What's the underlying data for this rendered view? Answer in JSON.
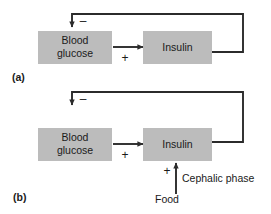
{
  "figure": {
    "background_color": "#ffffff",
    "box_fill_color": "#bcbcbc",
    "line_color": "#2b2b2b",
    "text_color": "#1a1a1a"
  },
  "panels": [
    {
      "id": "a",
      "label": "(a)",
      "nodes": [
        {
          "id": "blood-glucose",
          "label_line1": "Blood",
          "label_line2": "glucose"
        },
        {
          "id": "insulin",
          "label": "Insulin"
        }
      ],
      "edges": [
        {
          "id": "glucose-to-insulin",
          "sign": "+",
          "from": "blood-glucose",
          "to": "insulin"
        },
        {
          "id": "insulin-feedback",
          "sign": "–",
          "from": "insulin",
          "to": "blood-glucose"
        }
      ]
    },
    {
      "id": "b",
      "label": "(b)",
      "nodes": [
        {
          "id": "blood-glucose",
          "label_line1": "Blood",
          "label_line2": "glucose"
        },
        {
          "id": "insulin",
          "label": "Insulin"
        }
      ],
      "edges": [
        {
          "id": "glucose-to-insulin",
          "sign": "+",
          "from": "blood-glucose",
          "to": "insulin"
        },
        {
          "id": "insulin-feedback",
          "sign": "–",
          "from": "insulin",
          "to": "blood-glucose"
        },
        {
          "id": "cephalic-to-insulin",
          "sign": "+",
          "from": "food",
          "to": "insulin"
        }
      ],
      "annotations": [
        {
          "id": "cephalic-phase",
          "text": "Cephalic phase"
        },
        {
          "id": "food",
          "text": "Food"
        }
      ]
    }
  ]
}
